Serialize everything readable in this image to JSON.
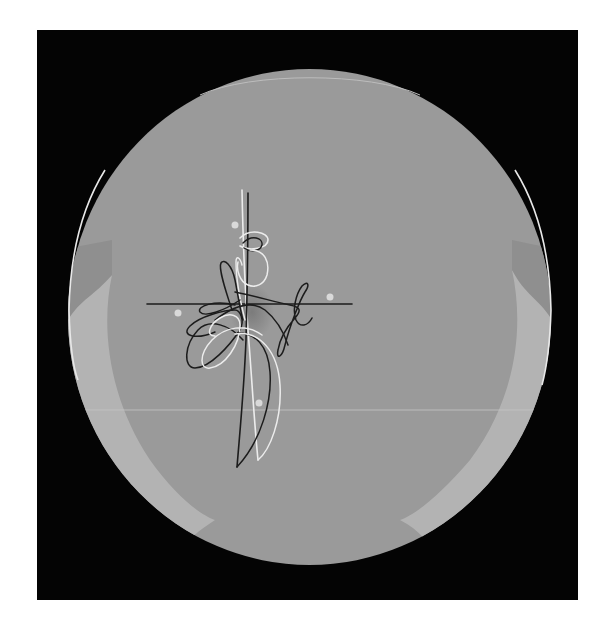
{
  "image": {
    "subject": "Decorative dinner plate with calligraphic line ornament",
    "alt": "Gray round plate on black background, decorated with black and white flourished lines forming a cross-like motif with small white dots"
  },
  "colors": {
    "page_background": "#ffffff",
    "backdrop": "#040404",
    "plate_face": "#9a9a9a",
    "plate_rim_highlight": "#b4b4b4",
    "plate_edge": "#e6e6e6",
    "line_dark": "#1a1a1a",
    "line_light": "#ececec",
    "dot": "#d9d9d9"
  },
  "plate": {
    "cx": 309.5,
    "cy": 317,
    "rx": 241.5,
    "ry": 248
  },
  "ornament": {
    "horizontal_bar": {
      "x1": 147,
      "x2": 352,
      "y": 304
    },
    "dots": [
      {
        "x": 235,
        "y": 225
      },
      {
        "x": 178,
        "y": 313
      },
      {
        "x": 330,
        "y": 297
      },
      {
        "x": 259,
        "y": 403
      }
    ]
  }
}
